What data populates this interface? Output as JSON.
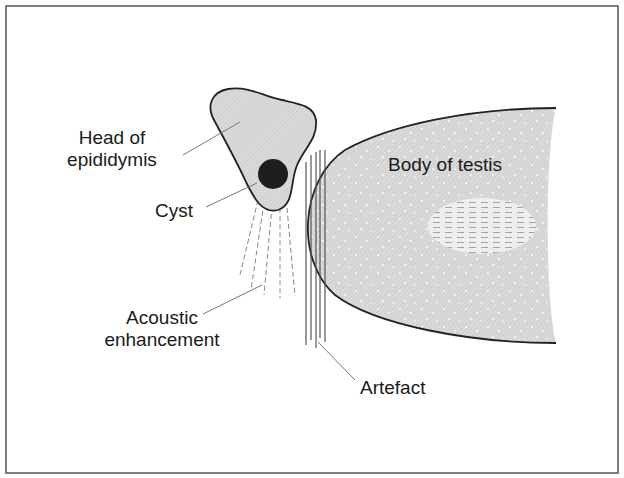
{
  "diagram": {
    "frame": {
      "stroke": "#555555"
    },
    "colors": {
      "tissue_fill": "#d4d4d4",
      "outline": "#222222",
      "cyst": "#1e1e1e",
      "leader": "#777777",
      "artefact_lines": "#555555",
      "enhancement_lines": "#888888",
      "lesion_fill": "#ececec",
      "lesion_dash": "#9a9a9a"
    },
    "labels": {
      "head_line1": "Head of",
      "head_line2": "epididymis",
      "cyst": "Cyst",
      "acoustic_line1": "Acoustic",
      "acoustic_line2": "enhancement",
      "body": "Body of testis",
      "artefact": "Artefact"
    },
    "structures": [
      {
        "id": "head-of-epididymis",
        "label": "Head of epididymis"
      },
      {
        "id": "cyst",
        "label": "Cyst"
      },
      {
        "id": "acoustic-enhancement",
        "label": "Acoustic enhancement"
      },
      {
        "id": "body-of-testis",
        "label": "Body of testis"
      },
      {
        "id": "artefact",
        "label": "Artefact"
      }
    ]
  }
}
